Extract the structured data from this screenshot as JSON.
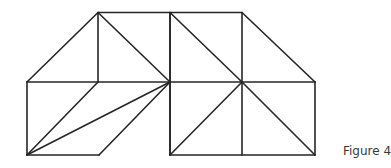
{
  "caption": "Figure 4",
  "stroke_color": "#262626",
  "vertices": {
    "A": [
      98,
      12.5
    ],
    "B": [
      170,
      12.5
    ],
    "C": [
      242,
      12.5
    ],
    "D": [
      27,
      82
    ],
    "E": [
      98,
      82
    ],
    "F": [
      170,
      82
    ],
    "G": [
      242,
      82
    ],
    "H": [
      315,
      82
    ],
    "I": [
      27,
      155
    ],
    "J": [
      99,
      155
    ],
    "K": [
      170,
      155
    ],
    "L": [
      242,
      155
    ],
    "M": [
      315,
      155
    ]
  },
  "segments": [
    [
      "A",
      "C"
    ],
    [
      "D",
      "H"
    ],
    [
      "I",
      "J"
    ],
    [
      "K",
      "M"
    ],
    [
      "D",
      "A"
    ],
    [
      "A",
      "E"
    ],
    [
      "A",
      "F"
    ],
    [
      "B",
      "F"
    ],
    [
      "B",
      "K"
    ],
    [
      "C",
      "G"
    ],
    [
      "C",
      "H"
    ],
    [
      "D",
      "I"
    ],
    [
      "E",
      "I"
    ],
    [
      "F",
      "I"
    ],
    [
      "J",
      "F"
    ],
    [
      "F",
      "K"
    ],
    [
      "G",
      "L"
    ],
    [
      "G",
      "K"
    ],
    [
      "G",
      "M"
    ],
    [
      "H",
      "M"
    ],
    [
      "B",
      "G"
    ]
  ]
}
